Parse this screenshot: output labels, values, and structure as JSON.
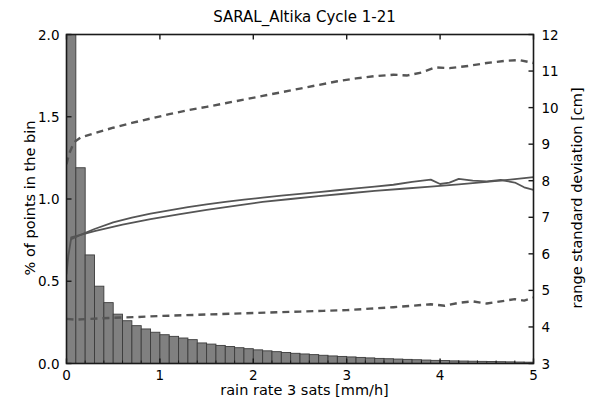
{
  "chart_data": {
    "type": "bar",
    "title": "SARAL_Altika Cycle 1-21",
    "xlabel": "rain rate 3 sats [mm/h]",
    "ylabel": "% of points in the bin",
    "ylabel_right": "range standard deviation [cm]",
    "xlim": [
      0,
      5
    ],
    "ylim": [
      0.0,
      2.0
    ],
    "ylim_right": [
      3,
      12
    ],
    "xticks": [
      0,
      1,
      2,
      3,
      4,
      5
    ],
    "xticklabels": [
      "0",
      "1",
      "2",
      "3",
      "4",
      "5"
    ],
    "yticks": [
      0.0,
      0.5,
      1.0,
      1.5,
      2.0
    ],
    "yticklabels": [
      "0.0",
      "0.5",
      "1.0",
      "1.5",
      "2.0"
    ],
    "yticks_right": [
      3,
      4,
      5,
      6,
      7,
      8,
      9,
      10,
      11,
      12
    ],
    "yticklabels_right": [
      "3",
      "4",
      "5",
      "6",
      "7",
      "8",
      "9",
      "10",
      "11",
      "12"
    ],
    "grid": false,
    "legend": null,
    "bar_color": "#808080",
    "bar_edge_color": "#3c3c3c",
    "line_color": "#555555",
    "bar_width": 0.1,
    "categories": [
      0.05,
      0.15,
      0.25,
      0.35,
      0.45,
      0.55,
      0.65,
      0.75,
      0.85,
      0.95,
      1.05,
      1.15,
      1.25,
      1.35,
      1.45,
      1.55,
      1.65,
      1.75,
      1.85,
      1.95,
      2.05,
      2.15,
      2.25,
      2.35,
      2.45,
      2.55,
      2.65,
      2.75,
      2.85,
      2.95,
      3.05,
      3.15,
      3.25,
      3.35,
      3.45,
      3.55,
      3.65,
      3.75,
      3.85,
      3.95,
      4.05,
      4.15,
      4.25,
      4.35,
      4.45,
      4.55,
      4.65,
      4.75,
      4.85,
      4.95
    ],
    "values": [
      3.95,
      1.19,
      0.66,
      0.47,
      0.37,
      0.3,
      0.26,
      0.23,
      0.21,
      0.19,
      0.175,
      0.165,
      0.155,
      0.145,
      0.125,
      0.118,
      0.11,
      0.103,
      0.096,
      0.09,
      0.083,
      0.077,
      0.072,
      0.067,
      0.062,
      0.058,
      0.054,
      0.05,
      0.046,
      0.043,
      0.04,
      0.037,
      0.034,
      0.031,
      0.029,
      0.027,
      0.025,
      0.023,
      0.021,
      0.019,
      0.018,
      0.016,
      0.015,
      0.014,
      0.013,
      0.012,
      0.011,
      0.01,
      0.009,
      0.008
    ],
    "series": [
      {
        "name": "mean range std (smooth)",
        "style": "solid",
        "axis": "right",
        "x": [
          0.05,
          0.3,
          0.6,
          0.9,
          1.2,
          1.5,
          1.8,
          2.1,
          2.4,
          2.7,
          3.0,
          3.3,
          3.6,
          3.9,
          4.2,
          4.5,
          4.75,
          5.0
        ],
        "y": [
          6.45,
          6.62,
          6.8,
          6.95,
          7.08,
          7.2,
          7.31,
          7.42,
          7.5,
          7.58,
          7.65,
          7.72,
          7.78,
          7.84,
          7.9,
          7.97,
          8.03,
          8.1
        ]
      },
      {
        "name": "mean range std (binned)",
        "style": "solid",
        "axis": "right",
        "x": [
          0.05,
          0.15,
          0.3,
          0.5,
          0.7,
          0.9,
          1.1,
          1.3,
          1.5,
          1.7,
          1.9,
          2.1,
          2.3,
          2.5,
          2.7,
          2.9,
          3.1,
          3.3,
          3.5,
          3.7,
          3.9,
          4.0,
          4.1,
          4.2,
          4.35,
          4.5,
          4.65,
          4.8,
          4.9,
          5.0
        ],
        "y": [
          6.4,
          6.52,
          6.68,
          6.86,
          6.99,
          7.1,
          7.19,
          7.28,
          7.35,
          7.42,
          7.48,
          7.54,
          7.59,
          7.64,
          7.69,
          7.74,
          7.79,
          7.84,
          7.89,
          7.97,
          8.03,
          7.91,
          7.95,
          8.05,
          8.0,
          7.98,
          8.02,
          7.95,
          7.82,
          7.75
        ]
      },
      {
        "name": "lead-in segment",
        "style": "solid",
        "axis": "right",
        "x": [
          0.0,
          0.02,
          0.05
        ],
        "y": [
          5.45,
          5.95,
          6.42
        ]
      },
      {
        "name": "upper percentile",
        "style": "dashed",
        "axis": "right",
        "x": [
          0.0,
          0.03,
          0.08,
          0.15,
          0.3,
          0.5,
          0.7,
          0.9,
          1.1,
          1.3,
          1.5,
          1.7,
          1.9,
          2.1,
          2.3,
          2.5,
          2.7,
          2.9,
          3.1,
          3.3,
          3.5,
          3.65,
          3.8,
          3.95,
          4.1,
          4.3,
          4.5,
          4.7,
          4.85,
          5.0
        ],
        "y": [
          8.45,
          8.75,
          9.05,
          9.18,
          9.3,
          9.45,
          9.58,
          9.7,
          9.82,
          9.93,
          10.02,
          10.12,
          10.22,
          10.32,
          10.42,
          10.52,
          10.62,
          10.72,
          10.8,
          10.86,
          10.9,
          10.88,
          10.96,
          11.1,
          11.08,
          11.14,
          11.22,
          11.28,
          11.3,
          11.22
        ]
      },
      {
        "name": "lower percentile",
        "style": "dashed",
        "axis": "right",
        "x": [
          0.0,
          0.1,
          0.25,
          0.5,
          0.75,
          1.0,
          1.25,
          1.5,
          1.75,
          2.0,
          2.25,
          2.5,
          2.75,
          3.0,
          3.25,
          3.5,
          3.7,
          3.9,
          4.05,
          4.2,
          4.35,
          4.5,
          4.65,
          4.8,
          4.9,
          5.0
        ],
        "y": [
          4.22,
          4.2,
          4.22,
          4.25,
          4.27,
          4.3,
          4.32,
          4.34,
          4.36,
          4.38,
          4.4,
          4.42,
          4.44,
          4.46,
          4.5,
          4.54,
          4.58,
          4.62,
          4.58,
          4.66,
          4.7,
          4.64,
          4.7,
          4.76,
          4.72,
          4.8
        ]
      }
    ]
  }
}
